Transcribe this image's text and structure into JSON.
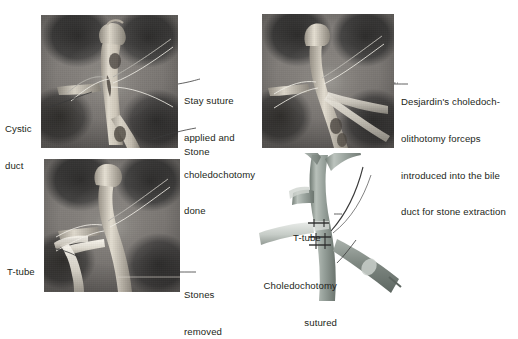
{
  "figure": {
    "background_color": "#ffffff",
    "text_color": "#231f20",
    "leader_line_color": "#3a3a3a"
  },
  "panels": [
    {
      "id": "panel-a",
      "name": "stay-suture-choledochotomy",
      "caption": "Stay suture applied and choledochotomy done",
      "labels": [
        {
          "name": "cystic-duct-label",
          "text": "Cystic\nduct"
        },
        {
          "name": "stay-suture-label",
          "text": "Stay suture\napplied and\ncholedochotomy\ndone"
        },
        {
          "name": "stone-label",
          "text": "Stone"
        }
      ]
    },
    {
      "id": "panel-b",
      "name": "forceps-stone-extraction",
      "caption": "Desjardin's choledocholithotomy forceps introduced into the bile duct for stone extraction",
      "labels": [
        {
          "name": "forceps-label",
          "text": "Desjardin's choledoch-\nolithotomy forceps\nintroduced into the bile\nduct for stone extraction"
        }
      ]
    },
    {
      "id": "panel-c",
      "name": "t-tube-placed-stones-removed",
      "caption": "T-tube placed, stones removed",
      "labels": [
        {
          "name": "t-tube-label",
          "text": "T-tube"
        },
        {
          "name": "stones-removed-label",
          "text": "Stones\nremoved"
        }
      ]
    },
    {
      "id": "panel-d",
      "name": "choledochotomy-sutured-schematic",
      "caption": "Choledochotomy sutured over T-tube",
      "labels": [
        {
          "name": "t-tube-label",
          "text": "T-tube"
        },
        {
          "name": "choledochotomy-sutured-label",
          "text": "Choledochotomy\nsutured"
        }
      ]
    }
  ],
  "label_text": {
    "cystic_duct_line1": "Cystic",
    "cystic_duct_line2": "duct",
    "stay_suture_line1": "Stay suture",
    "stay_suture_line2": "applied and",
    "stay_suture_line3": "choledochotomy",
    "stay_suture_line4": "done",
    "stone": "Stone",
    "forceps_line1": "Desjardin's choledoch-",
    "forceps_line2": "olithotomy forceps",
    "forceps_line3": "introduced into the bile",
    "forceps_line4": "duct for stone extraction",
    "t_tube_panel_c": "T-tube",
    "stones_removed_line1": "Stones",
    "stones_removed_line2": "removed",
    "t_tube_panel_d": "T-tube",
    "choledochotomy_sutured_line1": "Choledochotomy",
    "choledochotomy_sutured_line2": "sutured"
  }
}
